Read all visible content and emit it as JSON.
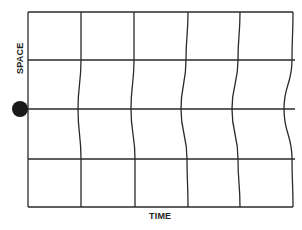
{
  "diagram": {
    "type": "spacetime-grid",
    "x_axis_label": "TIME",
    "y_axis_label": "SPACE",
    "line_color": "#2a2a2a",
    "dot_color": "#1a1a1a",
    "frame": {
      "left": 28,
      "top": 12,
      "right": 294,
      "bottom": 207
    },
    "horizontal_lines_y": [
      60,
      109,
      159
    ],
    "vertical_lines": [
      {
        "x_top": 81,
        "x_y60": 81,
        "x_y109": 78,
        "x_y159": 81,
        "x_bottom": 81
      },
      {
        "x_top": 134,
        "x_y60": 134,
        "x_y109": 131,
        "x_y159": 135,
        "x_bottom": 135
      },
      {
        "x_top": 188,
        "x_y60": 186,
        "x_y109": 181,
        "x_y159": 187,
        "x_bottom": 188
      },
      {
        "x_top": 240,
        "x_y60": 238,
        "x_y109": 232,
        "x_y159": 238,
        "x_bottom": 240
      },
      {
        "x_top": 293,
        "x_y60": 292,
        "x_y109": 284,
        "x_y159": 292,
        "x_bottom": 293
      }
    ],
    "source_dot": {
      "cx": 20,
      "cy": 109,
      "r": 8
    }
  }
}
